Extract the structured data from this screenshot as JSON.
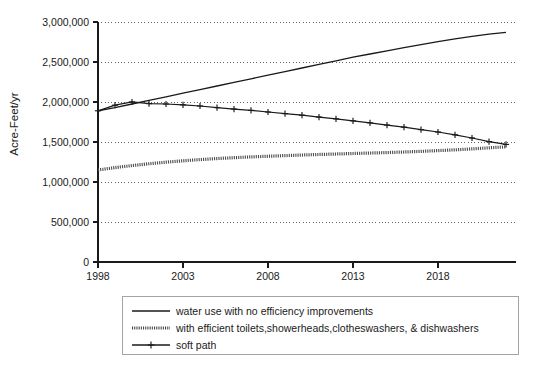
{
  "chart_data": {
    "type": "line",
    "title": "",
    "xlabel": "",
    "ylabel": "Acre-Feet/yr",
    "xlim": [
      1998,
      2022
    ],
    "ylim": [
      0,
      3000000
    ],
    "grid": true,
    "legend_position": "bottom",
    "xticks": [
      1998,
      2003,
      2008,
      2013,
      2018
    ],
    "xtick_labels": [
      "1998",
      "2003",
      "2008",
      "2013",
      "2018"
    ],
    "yticks": [
      0,
      500000,
      1000000,
      1500000,
      2000000,
      2500000,
      3000000
    ],
    "ytick_labels": [
      "0",
      "500,000",
      "1,000,000",
      "1,500,000",
      "2,000,000",
      "2,500,000",
      "3,000,000"
    ],
    "x": [
      1998,
      1999,
      2000,
      2001,
      2002,
      2003,
      2004,
      2005,
      2006,
      2007,
      2008,
      2009,
      2010,
      2011,
      2012,
      2013,
      2014,
      2015,
      2016,
      2017,
      2018,
      2019,
      2020,
      2021,
      2022
    ],
    "series": [
      {
        "name": "water use with no efficiency improvements",
        "style": "solid",
        "marker": "none",
        "color": "#1a1a1a",
        "values": [
          1890000,
          1930000,
          1975000,
          2020000,
          2065000,
          2110000,
          2155000,
          2200000,
          2245000,
          2290000,
          2335000,
          2380000,
          2425000,
          2470000,
          2515000,
          2560000,
          2600000,
          2640000,
          2680000,
          2718000,
          2755000,
          2790000,
          2820000,
          2848000,
          2870000
        ]
      },
      {
        "name": "with efficient toilets,showerheads,clotheswashers, & dishwashers",
        "style": "dotted",
        "marker": "none",
        "color": "#4a4a4a",
        "values": [
          1150000,
          1180000,
          1205000,
          1228000,
          1248000,
          1265000,
          1280000,
          1293000,
          1304000,
          1314000,
          1322000,
          1330000,
          1337000,
          1344000,
          1350000,
          1356000,
          1362000,
          1368000,
          1375000,
          1383000,
          1392000,
          1402000,
          1414000,
          1427000,
          1440000
        ]
      },
      {
        "name": "soft path",
        "style": "solid",
        "marker": "plus",
        "color": "#1a1a1a",
        "values": [
          1890000,
          1960000,
          2000000,
          1980000,
          1975000,
          1965000,
          1950000,
          1930000,
          1912000,
          1895000,
          1875000,
          1855000,
          1835000,
          1812000,
          1790000,
          1765000,
          1740000,
          1712000,
          1685000,
          1655000,
          1625000,
          1590000,
          1550000,
          1505000,
          1470000
        ]
      }
    ]
  },
  "legend": {
    "entries": [
      {
        "label": "water use with no efficiency improvements",
        "style": "solid"
      },
      {
        "label": "with efficient toilets,showerheads,clotheswashers, & dishwashers",
        "style": "dotted"
      },
      {
        "label": "soft path",
        "style": "solid-plus"
      }
    ]
  }
}
